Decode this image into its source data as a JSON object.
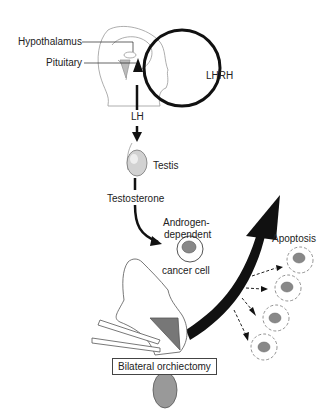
{
  "diagram": {
    "labels": {
      "hypothalamus": "Hypothalamus",
      "pituitary": "Pituitary",
      "lhrh": "LHRH",
      "lh": "LH",
      "testis": "Testis",
      "testosterone": "Testosterone",
      "androgen_line1": "Androgen-",
      "androgen_line2": "dependent",
      "cancer_cell": "cancer cell",
      "apoptosis": "Apoptosis",
      "procedure": "Bilateral orchiectomy"
    },
    "colors": {
      "line": "#111111",
      "outline": "#888888",
      "nucleus": "#8a8a8a",
      "testis_fill": "#cfcfcf"
    }
  }
}
